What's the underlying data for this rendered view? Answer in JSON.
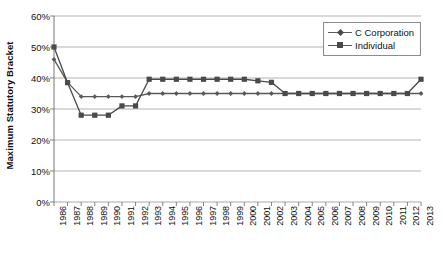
{
  "chart_data": {
    "type": "line",
    "title": "",
    "xlabel": "",
    "ylabel": "Maximum Statutory Bracket",
    "ylim": [
      0,
      60
    ],
    "yticks": [
      0,
      10,
      20,
      30,
      40,
      50,
      60
    ],
    "ytick_labels": [
      "0%",
      "10%",
      "20%",
      "30%",
      "40%",
      "50%",
      "60%"
    ],
    "grid": true,
    "legend_position": "top-right",
    "categories": [
      "1986",
      "1987",
      "1988",
      "1989",
      "1990",
      "1991",
      "1992",
      "1993",
      "1994",
      "1995",
      "1996",
      "1997",
      "1998",
      "1999",
      "2000",
      "2001",
      "2002",
      "2003",
      "2004",
      "2005",
      "2006",
      "2007",
      "2008",
      "2009",
      "2010",
      "2011",
      "2012",
      "2013"
    ],
    "series": [
      {
        "name": "C Corporation",
        "marker": "diamond",
        "color": "#595959",
        "values": [
          46.0,
          38.6,
          34.0,
          34.0,
          34.0,
          34.0,
          34.0,
          35.0,
          35.0,
          35.0,
          35.0,
          35.0,
          35.0,
          35.0,
          35.0,
          35.0,
          35.0,
          35.0,
          35.0,
          35.0,
          35.0,
          35.0,
          35.0,
          35.0,
          35.0,
          35.0,
          35.0,
          35.0
        ]
      },
      {
        "name": "Individual",
        "marker": "square",
        "color": "#4a4a4a",
        "values": [
          50.0,
          38.5,
          28.0,
          28.0,
          28.0,
          31.0,
          31.0,
          39.6,
          39.6,
          39.6,
          39.6,
          39.6,
          39.6,
          39.6,
          39.6,
          39.1,
          38.6,
          35.0,
          35.0,
          35.0,
          35.0,
          35.0,
          35.0,
          35.0,
          35.0,
          35.0,
          35.0,
          39.6
        ]
      }
    ]
  },
  "legend": {
    "items": [
      {
        "label": "C Corporation"
      },
      {
        "label": "Individual"
      }
    ]
  },
  "axes": {
    "y_title": "Maximum Statutory Bracket"
  }
}
